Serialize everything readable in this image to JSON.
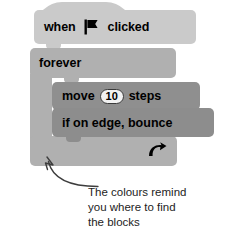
{
  "diagram": {
    "script": {
      "hat_block": {
        "label_before": "when",
        "icon": "green-flag-icon",
        "label_after": "clicked",
        "color": "#cacaca"
      },
      "loop_block": {
        "label": "forever",
        "loop_icon": "loop-arrow-icon",
        "color": "#b0b0b0"
      },
      "inner_blocks": [
        {
          "label_before": "move",
          "value": "10",
          "label_after": "steps",
          "color": "#8f8f8f"
        },
        {
          "label": "if on edge, bounce",
          "color": "#8d8d8d"
        }
      ]
    },
    "annotation": {
      "pointer": "curved-arrow-icon",
      "lines": [
        "The colours remind",
        "you where to find",
        "the blocks"
      ]
    }
  }
}
